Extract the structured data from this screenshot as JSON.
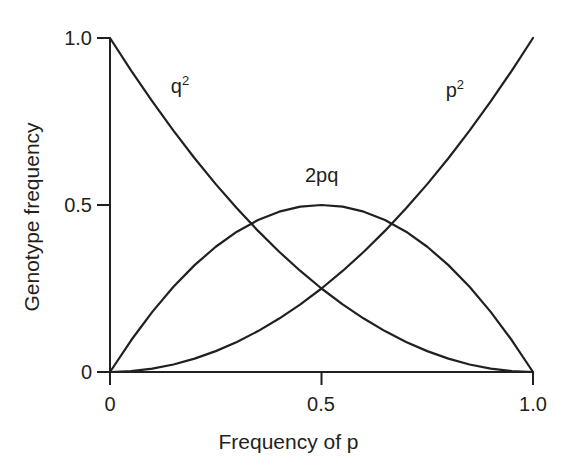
{
  "chart_data": {
    "type": "line",
    "title": "",
    "xlabel": "Frequency of p",
    "ylabel": "Genotype frequency",
    "xlim": [
      0,
      1
    ],
    "ylim": [
      0,
      1
    ],
    "grid": false,
    "legend": "inline curve labels",
    "x_ticks": [
      "0",
      "0.5",
      "1.0"
    ],
    "x_tick_values": [
      0,
      0.5,
      1
    ],
    "y_ticks": [
      "0",
      "0.5",
      "1.0"
    ],
    "y_tick_values": [
      0,
      0.5,
      1
    ],
    "x": [
      0,
      0.05,
      0.1,
      0.15,
      0.2,
      0.25,
      0.3,
      0.35,
      0.4,
      0.45,
      0.5,
      0.55,
      0.6,
      0.65,
      0.7,
      0.75,
      0.8,
      0.85,
      0.9,
      0.95,
      1
    ],
    "series": [
      {
        "name": "q2",
        "label": "q",
        "exponent": "2",
        "formula": "(1-p)^2",
        "label_x": 0.165,
        "label_y": 0.855,
        "values": [
          1,
          0.9025,
          0.81,
          0.7225,
          0.64,
          0.5625,
          0.49,
          0.4225,
          0.36,
          0.3025,
          0.25,
          0.2025,
          0.16,
          0.1225,
          0.09,
          0.0625,
          0.04,
          0.0225,
          0.01,
          0.0025,
          0
        ]
      },
      {
        "name": "2pq",
        "label": "2pq",
        "exponent": "",
        "formula": "2p(1-p)",
        "label_x": 0.5,
        "label_y": 0.59,
        "values": [
          0,
          0.095,
          0.18,
          0.255,
          0.32,
          0.375,
          0.42,
          0.455,
          0.48,
          0.495,
          0.5,
          0.495,
          0.48,
          0.455,
          0.42,
          0.375,
          0.32,
          0.255,
          0.18,
          0.095,
          0
        ]
      },
      {
        "name": "p2",
        "label": "p",
        "exponent": "2",
        "formula": "p^2",
        "label_x": 0.815,
        "label_y": 0.845,
        "values": [
          0,
          0.0025,
          0.01,
          0.0225,
          0.04,
          0.0625,
          0.09,
          0.1225,
          0.16,
          0.2025,
          0.25,
          0.3025,
          0.36,
          0.4225,
          0.49,
          0.5625,
          0.64,
          0.7225,
          0.81,
          0.9025,
          1
        ]
      }
    ],
    "colors": {
      "line": "#231f20",
      "axis": "#231f20",
      "background": "#ffffff"
    }
  }
}
